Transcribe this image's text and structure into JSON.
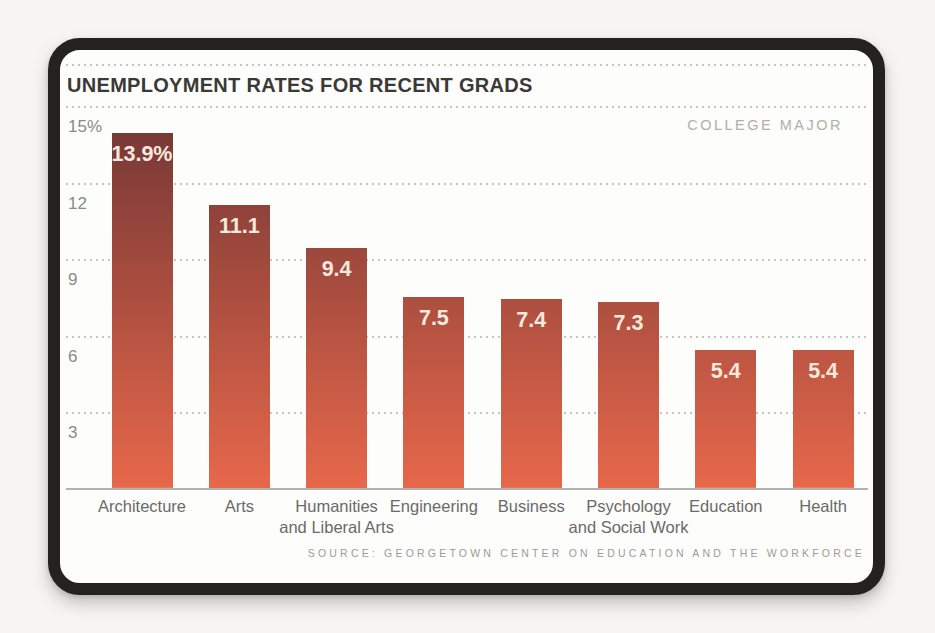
{
  "chart_data": {
    "type": "bar",
    "title": "UNEMPLOYMENT RATES FOR RECENT GRADS",
    "axis_corner_label": "COLLEGE MAJOR",
    "categories": [
      {
        "label": "Architecture",
        "lines": [
          "Architecture"
        ]
      },
      {
        "label": "Arts",
        "lines": [
          "Arts"
        ]
      },
      {
        "label": "Humanities and Liberal Arts",
        "lines": [
          "Humanities",
          "and Liberal Arts"
        ]
      },
      {
        "label": "Engineering",
        "lines": [
          "Engineering"
        ]
      },
      {
        "label": "Business",
        "lines": [
          "Business"
        ]
      },
      {
        "label": "Psychology and Social Work",
        "lines": [
          "Psychology",
          "and Social Work"
        ]
      },
      {
        "label": "Education",
        "lines": [
          "Education"
        ]
      },
      {
        "label": "Health",
        "lines": [
          "Health"
        ]
      }
    ],
    "values": [
      13.9,
      11.1,
      9.4,
      7.5,
      7.4,
      7.3,
      5.4,
      5.4
    ],
    "value_labels": [
      "13.9%",
      "11.1",
      "9.4",
      "7.5",
      "7.4",
      "7.3",
      "5.4",
      "5.4"
    ],
    "y_ticks": [
      {
        "value": 15,
        "label": "15%"
      },
      {
        "value": 12,
        "label": "12"
      },
      {
        "value": 9,
        "label": "9"
      },
      {
        "value": 6,
        "label": "6"
      },
      {
        "value": 3,
        "label": "3"
      }
    ],
    "ylim": [
      0,
      15
    ],
    "grid": "dotted horizontal",
    "legend": "none",
    "xlabel": "",
    "ylabel": "",
    "source": "SOURCE: GEORGETOWN CENTER ON EDUCATION AND THE WORKFORCE",
    "colors": {
      "bar_gradient_top": "#703534",
      "bar_gradient_bottom": "#e7684b",
      "value_label_text": "#f7e9de",
      "title_text": "#3a3936",
      "axis_tick_text": "#8b8a87",
      "category_text": "#6a6a68",
      "corner_label_text": "#b1afac",
      "source_text": "#9d9b97",
      "card_border": "#242220",
      "card_background": "#fdfdfb",
      "page_background": "#f6f5f2"
    }
  }
}
